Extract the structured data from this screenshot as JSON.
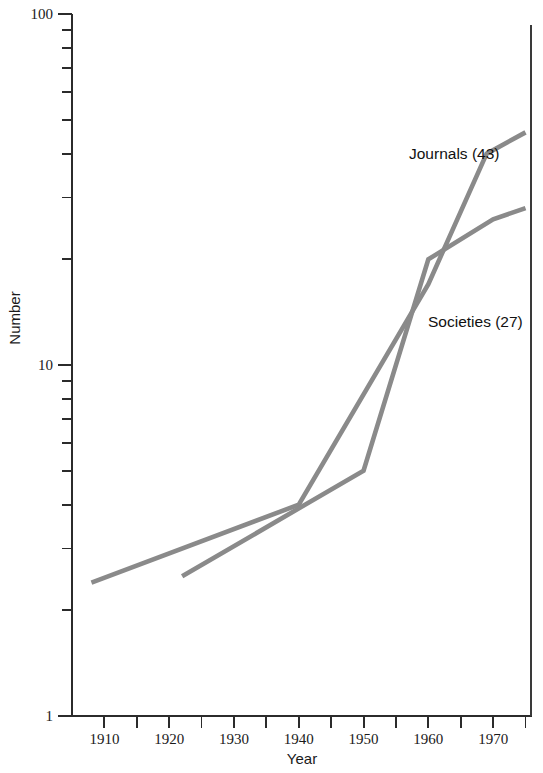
{
  "chart_data": {
    "type": "line",
    "title": "",
    "xlabel": "Year",
    "ylabel": "Number",
    "xlim": [
      1905,
      1976
    ],
    "ylim": [
      1,
      100
    ],
    "yscale": "log",
    "grid": false,
    "legend_position": "inline-annotation",
    "x_tick_labels": [
      "1910",
      "1920",
      "1930",
      "1940",
      "1950",
      "1960",
      "1970"
    ],
    "x_major_ticks": [
      1910,
      1920,
      1930,
      1940,
      1950,
      1960,
      1970
    ],
    "x_minor_ticks": [
      1915,
      1925,
      1935,
      1945,
      1955,
      1965,
      1975
    ],
    "y_tick_labels": [
      "100",
      "10",
      "1"
    ],
    "y_major_ticks": [
      1,
      10,
      100
    ],
    "y_minor_ticks": [
      2,
      3,
      4,
      5,
      6,
      7,
      8,
      9,
      20,
      30,
      40,
      50,
      60,
      70,
      80,
      90
    ],
    "series": [
      {
        "name": "Journals",
        "label": "Journals  (43)",
        "final_value": 43,
        "color": "#8a8a8a",
        "x": [
          1908,
          1940,
          1960,
          1969,
          1975
        ],
        "values": [
          2.4,
          4.0,
          17.0,
          40.0,
          46.0
        ]
      },
      {
        "name": "Societies",
        "label": "Societies  (27)",
        "final_value": 27,
        "color": "#8a8a8a",
        "x": [
          1922,
          1950,
          1960,
          1970,
          1975
        ],
        "values": [
          2.5,
          5.0,
          20.0,
          26.0,
          28.0
        ]
      }
    ],
    "annotations": [
      {
        "text": "Journals  (43)",
        "x_px": 409,
        "y_px": 159
      },
      {
        "text": "Societies  (27)",
        "x_px": 428,
        "y_px": 327
      }
    ]
  },
  "axis": {
    "x_title": "Year",
    "y_title": "Number"
  }
}
